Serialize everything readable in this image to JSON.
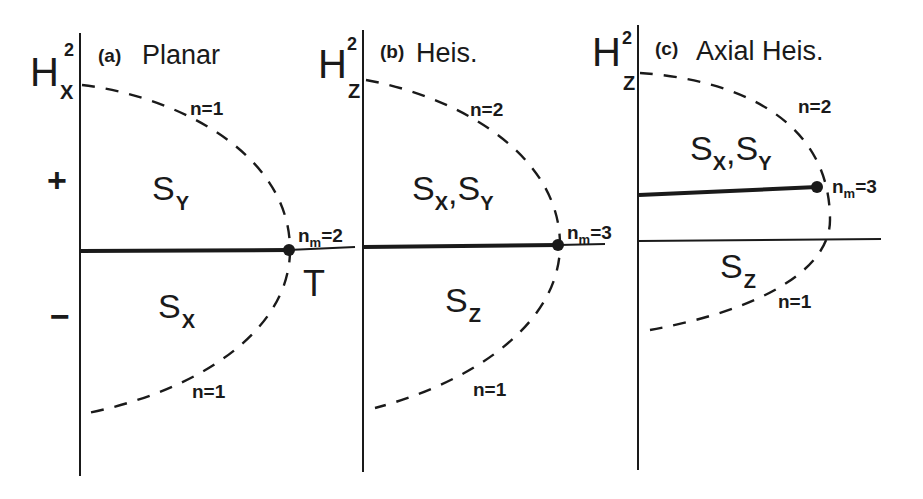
{
  "figure": {
    "panels": [
      {
        "id": "a",
        "title_tag": "(a)",
        "title": "Planar",
        "axis_label": "H",
        "axis_sub": "X",
        "axis_sup": "2",
        "sign_plus": "+",
        "sign_minus": "−",
        "region_upper": {
          "main": "S",
          "sub": "Y"
        },
        "region_lower": {
          "main": "S",
          "sub": "X"
        },
        "curve_upper_label": "n=1",
        "curve_lower_label": "n=1",
        "point_label_n": "n",
        "point_label_sub": "m",
        "point_label_val": "=2",
        "point_extra": "T"
      },
      {
        "id": "b",
        "title_tag": "(b)",
        "title": "Heis.",
        "axis_label": "H",
        "axis_sub": "Z",
        "axis_sup": "2",
        "region_upper": {
          "main1": "S",
          "sub1": "X",
          "sep": ",",
          "main2": "S",
          "sub2": "Y"
        },
        "region_lower": {
          "main": "S",
          "sub": "Z"
        },
        "curve_upper_label": "n=2",
        "curve_lower_label": "n=1",
        "point_label_n": "n",
        "point_label_sub": "m",
        "point_label_val": "=3"
      },
      {
        "id": "c",
        "title_tag": "(c)",
        "title": "Axial Heis.",
        "axis_label": "H",
        "axis_sub": "Z",
        "axis_sup": "2",
        "region_upper": {
          "main1": "S",
          "sub1": "X",
          "sep": ",",
          "main2": "S",
          "sub2": "Y"
        },
        "region_lower": {
          "main": "S",
          "sub": "Z"
        },
        "curve_upper_label": "n=2",
        "curve_lower_label": "n=1",
        "point_label_n": "n",
        "point_label_sub": "m",
        "point_label_val": "=3"
      }
    ],
    "colors": {
      "ink": "#1a1a1a",
      "background": "#ffffff"
    }
  }
}
